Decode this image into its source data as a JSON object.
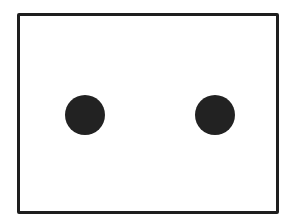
{
  "diagram": {
    "shapes": [
      {
        "type": "rectangle",
        "name": "frame",
        "stroke": "#1e1e1e",
        "fill": "#ffffff"
      },
      {
        "type": "circle",
        "name": "left-dot",
        "fill": "#222222"
      },
      {
        "type": "circle",
        "name": "right-dot",
        "fill": "#222222"
      }
    ],
    "colors": {
      "background": "#ffffff",
      "stroke": "#1e1e1e",
      "dot": "#222222"
    }
  }
}
